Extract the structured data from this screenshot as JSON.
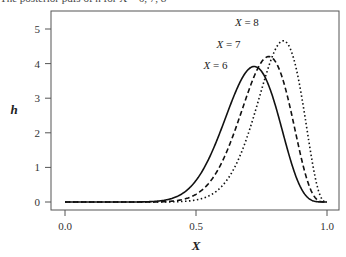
{
  "caption": "The posterior pdfs of h for X = 6, 7, 8",
  "chart_data": {
    "type": "line",
    "title": "",
    "xlabel": "X",
    "ylabel": "h",
    "xlim": [
      0,
      1
    ],
    "ylim": [
      0,
      5
    ],
    "x_ticks": [
      "0.0",
      "0.5",
      "1.0"
    ],
    "y_ticks": [
      "0",
      "1",
      "2",
      "3",
      "4",
      "5"
    ],
    "grid": false,
    "legend": "inline annotations",
    "series": [
      {
        "name": "X = 6",
        "style": "solid",
        "dist": [
          14,
          6
        ],
        "peak_x": 0.72,
        "peak_y": 4.2
      },
      {
        "name": "X = 7",
        "style": "dashed",
        "dist": [
          15,
          5
        ],
        "peak_x": 0.78,
        "peak_y": 4.55
      },
      {
        "name": "X = 8",
        "style": "dotted",
        "dist": [
          16,
          4
        ],
        "peak_x": 0.83,
        "peak_y": 5.0
      }
    ],
    "annotations": [
      {
        "text": "X = 6",
        "x": 0.62,
        "y": 3.85
      },
      {
        "text": "X = 7",
        "x": 0.67,
        "y": 4.45
      },
      {
        "text": "X = 8",
        "x": 0.74,
        "y": 5.1
      }
    ]
  }
}
